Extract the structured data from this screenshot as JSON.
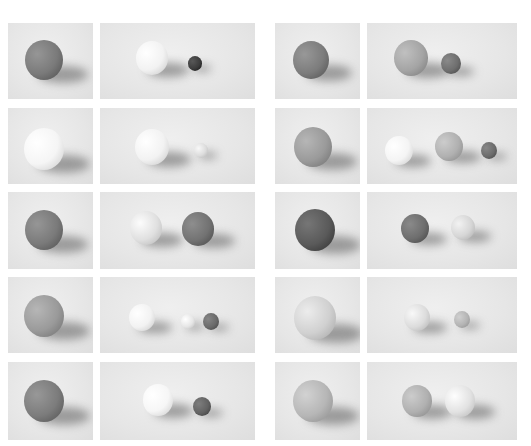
{
  "layout": {
    "columns": [
      {
        "x": 8,
        "w": 85
      },
      {
        "x": 100,
        "w": 155
      },
      {
        "x": 275,
        "w": 85
      },
      {
        "x": 367,
        "w": 150
      }
    ],
    "rows": [
      {
        "y": 23,
        "h": 76
      },
      {
        "y": 108,
        "h": 76
      },
      {
        "y": 192,
        "h": 77
      },
      {
        "y": 277,
        "h": 76
      },
      {
        "y": 362,
        "h": 78
      }
    ]
  },
  "panels": [
    {
      "row": 0,
      "col": 0,
      "balls": [
        {
          "cx": 36,
          "cy": 36,
          "r": 19,
          "tone": "#7a7a7a"
        }
      ]
    },
    {
      "row": 0,
      "col": 1,
      "balls": [
        {
          "cx": 52,
          "cy": 34,
          "r": 16,
          "tone": "#f2f2f2"
        },
        {
          "cx": 95,
          "cy": 40,
          "r": 7,
          "tone": "#3c3c3c"
        }
      ]
    },
    {
      "row": 0,
      "col": 2,
      "balls": [
        {
          "cx": 36,
          "cy": 36,
          "r": 18,
          "tone": "#7c7c7c"
        }
      ]
    },
    {
      "row": 0,
      "col": 3,
      "balls": [
        {
          "cx": 44,
          "cy": 34,
          "r": 17,
          "tone": "#a4a4a4"
        },
        {
          "cx": 84,
          "cy": 40,
          "r": 10,
          "tone": "#6e6e6e"
        }
      ]
    },
    {
      "row": 1,
      "col": 0,
      "balls": [
        {
          "cx": 36,
          "cy": 40,
          "r": 20,
          "tone": "#f5f5f5"
        }
      ]
    },
    {
      "row": 1,
      "col": 1,
      "balls": [
        {
          "cx": 52,
          "cy": 38,
          "r": 17,
          "tone": "#f2f2f2"
        },
        {
          "cx": 101,
          "cy": 42,
          "r": 7,
          "tone": "#dcdcdc"
        }
      ]
    },
    {
      "row": 1,
      "col": 2,
      "balls": [
        {
          "cx": 38,
          "cy": 38,
          "r": 19,
          "tone": "#9a9a9a"
        }
      ]
    },
    {
      "row": 1,
      "col": 3,
      "balls": [
        {
          "cx": 32,
          "cy": 42,
          "r": 14,
          "tone": "#f4f4f4"
        },
        {
          "cx": 82,
          "cy": 38,
          "r": 14,
          "tone": "#b0b0b0"
        },
        {
          "cx": 122,
          "cy": 42,
          "r": 8,
          "tone": "#6c6c6c"
        }
      ]
    },
    {
      "row": 2,
      "col": 0,
      "balls": [
        {
          "cx": 36,
          "cy": 37,
          "r": 19,
          "tone": "#7a7a7a"
        }
      ]
    },
    {
      "row": 2,
      "col": 1,
      "balls": [
        {
          "cx": 46,
          "cy": 35,
          "r": 16,
          "tone": "#e0e0e0"
        },
        {
          "cx": 98,
          "cy": 36,
          "r": 16,
          "tone": "#727272"
        }
      ]
    },
    {
      "row": 2,
      "col": 2,
      "balls": [
        {
          "cx": 40,
          "cy": 37,
          "r": 20,
          "tone": "#5a5a5a"
        }
      ]
    },
    {
      "row": 2,
      "col": 3,
      "balls": [
        {
          "cx": 48,
          "cy": 36,
          "r": 14,
          "tone": "#6e6e6e"
        },
        {
          "cx": 96,
          "cy": 35,
          "r": 12,
          "tone": "#d6d6d6"
        }
      ]
    },
    {
      "row": 3,
      "col": 0,
      "balls": [
        {
          "cx": 36,
          "cy": 38,
          "r": 20,
          "tone": "#9a9a9a"
        }
      ]
    },
    {
      "row": 3,
      "col": 1,
      "balls": [
        {
          "cx": 42,
          "cy": 40,
          "r": 13,
          "tone": "#f2f2f2"
        },
        {
          "cx": 88,
          "cy": 44,
          "r": 7,
          "tone": "#e6e6e6"
        },
        {
          "cx": 111,
          "cy": 44,
          "r": 8,
          "tone": "#6a6a6a"
        }
      ]
    },
    {
      "row": 3,
      "col": 2,
      "balls": [
        {
          "cx": 40,
          "cy": 40,
          "r": 21,
          "tone": "#d0d0d0"
        }
      ]
    },
    {
      "row": 3,
      "col": 3,
      "balls": [
        {
          "cx": 50,
          "cy": 40,
          "r": 13,
          "tone": "#dcdcdc"
        },
        {
          "cx": 95,
          "cy": 42,
          "r": 8,
          "tone": "#b4b4b4"
        }
      ]
    },
    {
      "row": 4,
      "col": 0,
      "balls": [
        {
          "cx": 36,
          "cy": 38,
          "r": 20,
          "tone": "#7c7c7c"
        }
      ]
    },
    {
      "row": 4,
      "col": 1,
      "balls": [
        {
          "cx": 58,
          "cy": 37,
          "r": 15,
          "tone": "#f6f6f6"
        },
        {
          "cx": 102,
          "cy": 44,
          "r": 9,
          "tone": "#626262"
        }
      ]
    },
    {
      "row": 4,
      "col": 2,
      "balls": [
        {
          "cx": 38,
          "cy": 38,
          "r": 20,
          "tone": "#b6b6b6"
        }
      ]
    },
    {
      "row": 4,
      "col": 3,
      "balls": [
        {
          "cx": 50,
          "cy": 38,
          "r": 15,
          "tone": "#b0b0b0"
        },
        {
          "cx": 93,
          "cy": 38,
          "r": 15,
          "tone": "#e2e2e2"
        }
      ]
    }
  ]
}
